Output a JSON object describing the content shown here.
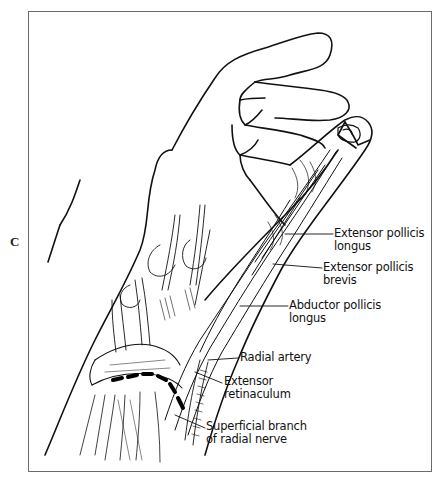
{
  "figure": {
    "panel_letter": "C",
    "labels": [
      {
        "id": "epl",
        "line1": "Extensor pollicis",
        "line2": "longus"
      },
      {
        "id": "epb",
        "line1": "Extensor pollicis",
        "line2": "brevis"
      },
      {
        "id": "apl",
        "line1": "Abductor pollicis",
        "line2": "longus"
      },
      {
        "id": "ra",
        "line1": "Radial artery",
        "line2": ""
      },
      {
        "id": "er",
        "line1": "Extensor",
        "line2": "retinaculum"
      },
      {
        "id": "sbrn",
        "line1": "Superficial branch",
        "line2": "of radial nerve"
      }
    ],
    "colors": {
      "ink": "#111111",
      "frame": "#6b6b6b",
      "background": "#ffffff"
    }
  }
}
